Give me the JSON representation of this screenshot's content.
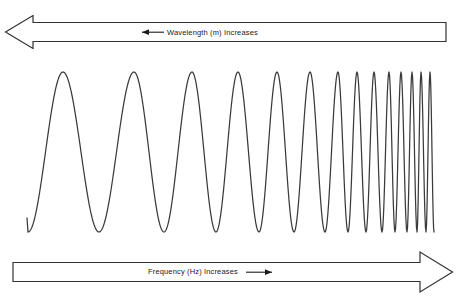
{
  "figure": {
    "background_color": "#ffffff",
    "stroke_color": "#3a3a3a",
    "text_color": "#1a1a1a"
  },
  "top_arrow": {
    "name": "wavelength-arrow",
    "label": "Wavelength (m) Increases",
    "direction": "left",
    "inline_arrow_glyph": "←",
    "bar_from_x": 33,
    "bar_to_x": 446,
    "tip_x": 5
  },
  "bottom_arrow": {
    "name": "frequency-arrow",
    "label": "Frequency (Hz) Increases",
    "direction": "right",
    "inline_arrow_glyph": "→",
    "bar_from_x": 13,
    "bar_to_x": 420,
    "tip_x": 452
  },
  "chart_data": {
    "type": "line",
    "title": "",
    "xlabel": "Wavelength (m) Increases (leftward) / Frequency (Hz) Increases (rightward)",
    "ylabel": "",
    "grid": false,
    "legend": null,
    "series": [
      {
        "name": "chirp-wave",
        "description": "Sinusoid of constant amplitude whose frequency increases monotonically from left to right",
        "x_start_px": 27,
        "x_end_px": 434,
        "y_peak_px": 72,
        "y_trough_px": 232,
        "y_center_px": 152,
        "amplitude_px": 80,
        "peak_count": 14,
        "trough_count": 14,
        "start_phase": "trough",
        "peak_x_px": [
          63,
          134,
          192,
          238,
          277,
          310,
          338,
          357,
          374,
          389,
          401,
          412,
          421,
          430
        ],
        "trough_x_px": [
          28,
          99,
          164,
          216,
          259,
          294,
          325,
          348,
          366,
          382,
          395,
          407,
          417,
          426
        ],
        "wavelength_px": [
          71,
          65,
          52,
          43,
          35,
          31,
          24,
          19,
          17,
          15,
          13,
          11,
          9,
          9
        ]
      }
    ]
  }
}
